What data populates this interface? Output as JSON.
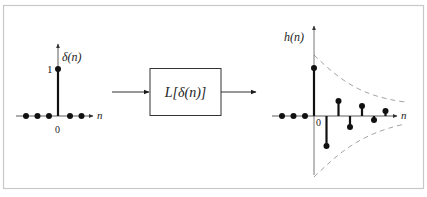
{
  "figure": {
    "border_color": "#c8c8c8",
    "ink_color": "#1a1a1a",
    "envelope_color": "#9a9a9a"
  },
  "input_plot": {
    "signal_label": "δ(n)",
    "axis_label_n": "n",
    "origin_label": "0",
    "unit_label": "1",
    "samples": [
      {
        "n": -3,
        "value": 0
      },
      {
        "n": -2,
        "value": 0
      },
      {
        "n": -1,
        "value": 0
      },
      {
        "n": 0,
        "value": 1
      },
      {
        "n": 1,
        "value": 0
      },
      {
        "n": 2,
        "value": 0
      }
    ]
  },
  "system_block": {
    "label": "L[δ(n)]"
  },
  "output_plot": {
    "signal_label": "h(n)",
    "axis_label_n": "n",
    "origin_label": "0",
    "samples": [
      {
        "n": -3,
        "value": 0
      },
      {
        "n": -2,
        "value": 0
      },
      {
        "n": -1,
        "value": 0
      },
      {
        "n": 0,
        "value": 1.0
      },
      {
        "n": 1,
        "value": -0.6
      },
      {
        "n": 2,
        "value": 0.32
      },
      {
        "n": 3,
        "value": -0.22
      },
      {
        "n": 4,
        "value": 0.2
      },
      {
        "n": 5,
        "value": -0.08
      },
      {
        "n": 6,
        "value": 0.1
      }
    ],
    "envelope": "decaying exponential (dashed, upper and lower)"
  }
}
